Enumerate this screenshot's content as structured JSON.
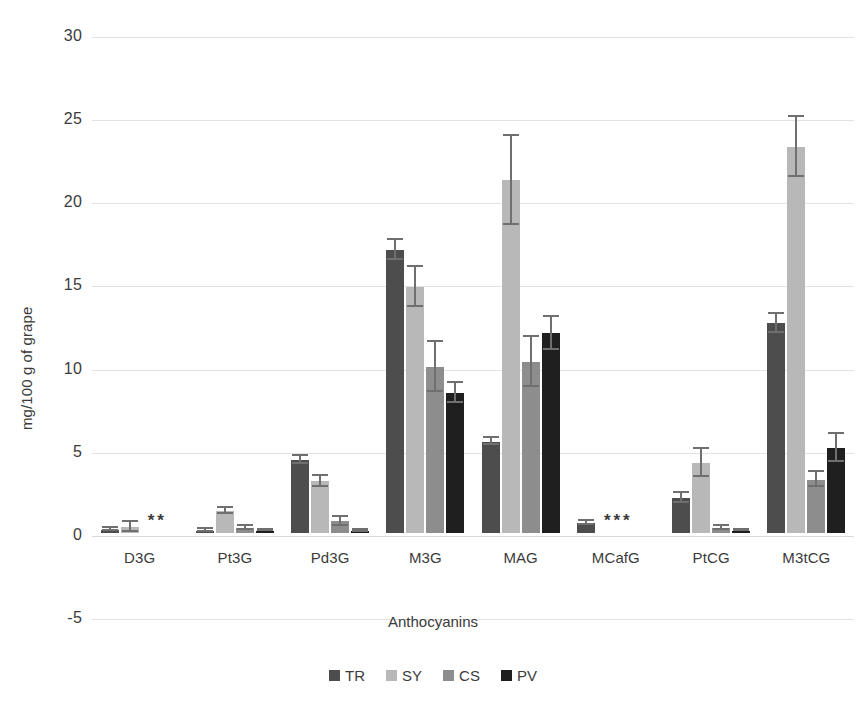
{
  "chart_data": {
    "type": "bar",
    "title": "",
    "subtitle": "",
    "xlabel": "Anthocyanins",
    "ylabel": "mg/100 g of grape",
    "ylim": [
      -5,
      30
    ],
    "yticks": [
      30,
      25,
      20,
      15,
      10,
      5,
      0,
      -5
    ],
    "grid": true,
    "legend_position": "bottom",
    "categories": [
      "D3G",
      "Pt3G",
      "Pd3G",
      "M3G",
      "MAG",
      "MCafG",
      "PtCG",
      "M3tCG"
    ],
    "series": [
      {
        "name": "TR",
        "color": "#4d4d4d",
        "values": [
          0.2,
          0.15,
          4.4,
          17.0,
          5.5,
          0.6,
          2.1,
          12.6
        ],
        "errors": [
          0.08,
          0.07,
          0.25,
          0.6,
          0.2,
          0.12,
          0.3,
          0.6
        ]
      },
      {
        "name": "SY",
        "color": "#b8b8b8",
        "values": [
          0.35,
          1.3,
          3.1,
          14.8,
          21.2,
          null,
          4.2,
          23.2
        ],
        "errors": [
          0.3,
          0.18,
          0.35,
          1.2,
          2.7,
          null,
          0.85,
          1.8
        ]
      },
      {
        "name": "CS",
        "color": "#8d8d8d",
        "values": [
          null,
          0.3,
          0.7,
          10.0,
          10.3,
          null,
          0.3,
          3.2
        ],
        "errors": [
          null,
          0.1,
          0.25,
          1.5,
          1.5,
          null,
          0.1,
          0.45
        ]
      },
      {
        "name": "PV",
        "color": "#1f1f1f",
        "values": [
          null,
          0.15,
          0.12,
          8.4,
          12.0,
          null,
          0.15,
          5.1
        ],
        "errors": [
          null,
          0.05,
          0.05,
          0.6,
          1.0,
          null,
          0.05,
          0.85
        ]
      }
    ],
    "annotations": [
      {
        "category": "D3G",
        "text": "**",
        "note": "CS and PV not detected"
      },
      {
        "category": "MCafG",
        "text": "***",
        "note": "SY, CS and PV not detected"
      }
    ]
  },
  "legend": {
    "items": [
      {
        "label": "TR",
        "color": "#4d4d4d"
      },
      {
        "label": "SY",
        "color": "#b8b8b8"
      },
      {
        "label": "CS",
        "color": "#8d8d8d"
      },
      {
        "label": "PV",
        "color": "#1f1f1f"
      }
    ]
  }
}
